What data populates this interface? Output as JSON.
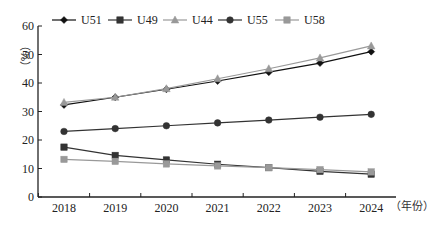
{
  "chart_data": {
    "type": "line",
    "title": "",
    "xlabel": "（年份）",
    "ylabel": "（%）",
    "ylim": [
      0,
      60
    ],
    "yticks": [
      0,
      10,
      20,
      30,
      40,
      50,
      60
    ],
    "grid": false,
    "legend_position": "top",
    "categories": [
      "2018",
      "2019",
      "2020",
      "2021",
      "2022",
      "2023",
      "2024"
    ],
    "series": [
      {
        "name": "U51",
        "marker": "diamond",
        "color": "#111111",
        "values": [
          32.3,
          35.0,
          37.8,
          40.7,
          43.8,
          47.0,
          51.0
        ]
      },
      {
        "name": "U49",
        "marker": "square",
        "color": "#333333",
        "values": [
          17.5,
          14.6,
          13.0,
          11.5,
          10.3,
          9.0,
          8.0
        ]
      },
      {
        "name": "U44",
        "marker": "triangle",
        "color": "#999999",
        "values": [
          33.2,
          35.0,
          38.0,
          41.5,
          45.0,
          48.8,
          53.0
        ]
      },
      {
        "name": "U55",
        "marker": "circle",
        "color": "#333333",
        "values": [
          23.0,
          24.0,
          25.0,
          26.0,
          27.0,
          28.0,
          29.0
        ]
      },
      {
        "name": "U58",
        "marker": "square",
        "color": "#999999",
        "values": [
          13.2,
          12.5,
          11.6,
          10.9,
          10.3,
          9.6,
          8.8
        ]
      }
    ]
  }
}
